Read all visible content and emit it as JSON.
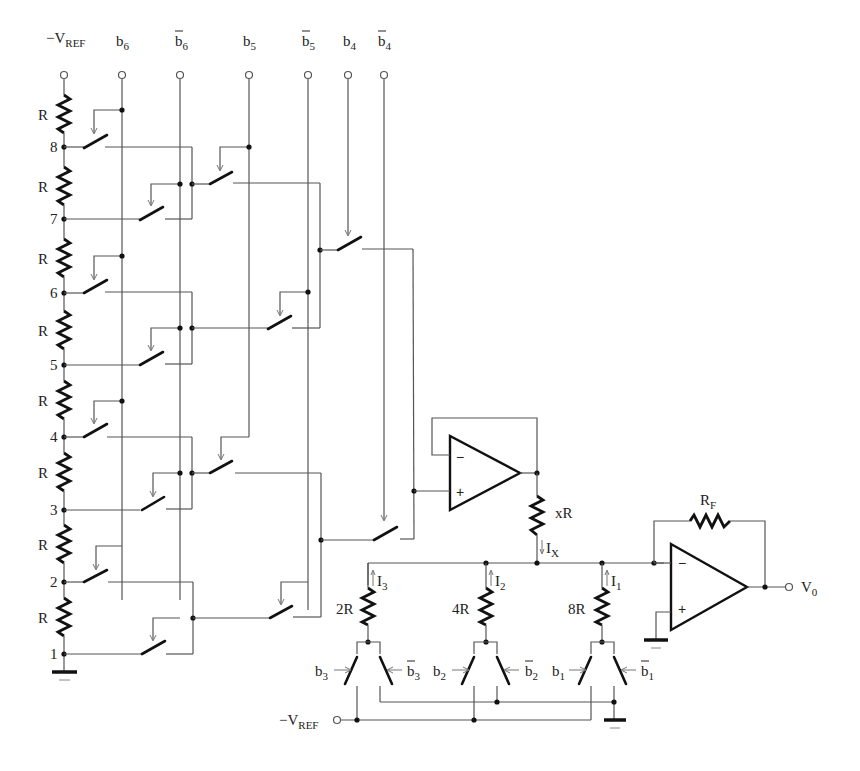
{
  "colors": {
    "wire": "#555555",
    "component": "#111111",
    "background": "#ffffff"
  },
  "top_terminals": [
    {
      "id": "vref",
      "main": "−V",
      "sub": "REF",
      "bar": false
    },
    {
      "id": "b6",
      "main": "b",
      "sub": "6",
      "bar": false
    },
    {
      "id": "b6bar",
      "main": "b",
      "sub": "6",
      "bar": true
    },
    {
      "id": "b5",
      "main": "b",
      "sub": "5",
      "bar": false
    },
    {
      "id": "b5bar",
      "main": "b",
      "sub": "5",
      "bar": true
    },
    {
      "id": "b4",
      "main": "b",
      "sub": "4",
      "bar": false
    },
    {
      "id": "b4bar",
      "main": "b",
      "sub": "4",
      "bar": true
    }
  ],
  "string": {
    "resistor_label": "R",
    "resistor_count": 8,
    "nodes": [
      "8",
      "7",
      "6",
      "5",
      "4",
      "3",
      "2",
      "1"
    ]
  },
  "buffer_amp": {
    "minus": "−",
    "plus": "+",
    "series_resistor": "xR",
    "current": {
      "main": "I",
      "sub": "X"
    }
  },
  "binary_branches": [
    {
      "resistor": "2R",
      "current": {
        "main": "I",
        "sub": "3"
      },
      "switch_on": {
        "main": "b",
        "sub": "3"
      },
      "switch_off": {
        "main": "b",
        "sub": "3",
        "bar": true
      }
    },
    {
      "resistor": "4R",
      "current": {
        "main": "I",
        "sub": "2"
      },
      "switch_on": {
        "main": "b",
        "sub": "2"
      },
      "switch_off": {
        "main": "b",
        "sub": "2",
        "bar": true
      }
    },
    {
      "resistor": "8R",
      "current": {
        "main": "I",
        "sub": "1"
      },
      "switch_on": {
        "main": "b",
        "sub": "1"
      },
      "switch_off": {
        "main": "b",
        "sub": "1",
        "bar": true
      }
    }
  ],
  "bottom_vref": {
    "main": "−V",
    "sub": "REF"
  },
  "output_amp": {
    "minus": "−",
    "plus": "+",
    "feedback": {
      "main": "R",
      "sub": "F"
    },
    "output": {
      "main": "V",
      "sub": "0"
    }
  }
}
